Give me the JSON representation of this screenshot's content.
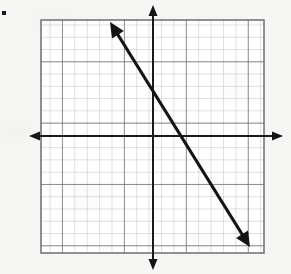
{
  "figure": {
    "kind": "coordinate-plane-line-graph",
    "background_color": "#f6f6f4",
    "width": 291,
    "height": 274,
    "corner_mark": {
      "present": true,
      "shape": "small-black-square",
      "x": 4,
      "y": 13,
      "size": 4,
      "color": "#1a1a1a"
    }
  },
  "grid": {
    "left": 41,
    "top": 20,
    "right": 264,
    "bottom": 253,
    "cell_size": 12.4,
    "columns": 18,
    "rows": 19,
    "minor_color": "#b9b9b9",
    "major_color": "#6e6e6e",
    "major_every": 5,
    "border_color": "#6e6e6e",
    "fill_color": "#ffffff"
  },
  "axes": {
    "x_axis": {
      "label": "x-axis",
      "pixel_y": 136,
      "start_x": 29,
      "end_x": 283,
      "color": "#1a1a1a",
      "stroke_width": 2,
      "arrow_left": true,
      "arrow_right": true
    },
    "y_axis": {
      "label": "y-axis",
      "pixel_x": 153,
      "start_y": 5,
      "end_y": 270,
      "color": "#1a1a1a",
      "stroke_width": 2,
      "arrow_up": true,
      "arrow_down": true
    },
    "origin": {
      "pixel_x": 153,
      "pixel_y": 136
    },
    "tick_labels": [],
    "axis_titles": []
  },
  "chart_data": {
    "type": "line",
    "title": "",
    "xlabel": "",
    "ylabel": "",
    "grid": true,
    "legend": null,
    "xlim": [
      -9,
      9
    ],
    "ylim": [
      -9.4,
      9.6
    ],
    "series": [
      {
        "name": "line",
        "style": "double-headed-arrow",
        "color": "#141414",
        "stroke_width": 3,
        "slope": -1.6,
        "y_intercept": -1.4,
        "x_intercept": 1.4,
        "pixel_endpoints": [
          {
            "x": 110,
            "y": 22
          },
          {
            "x": 250,
            "y": 247
          }
        ],
        "graph_points": [
          {
            "x": -3.5,
            "y": 9.2
          },
          {
            "x": 7.8,
            "y": -9.0
          }
        ]
      }
    ]
  }
}
